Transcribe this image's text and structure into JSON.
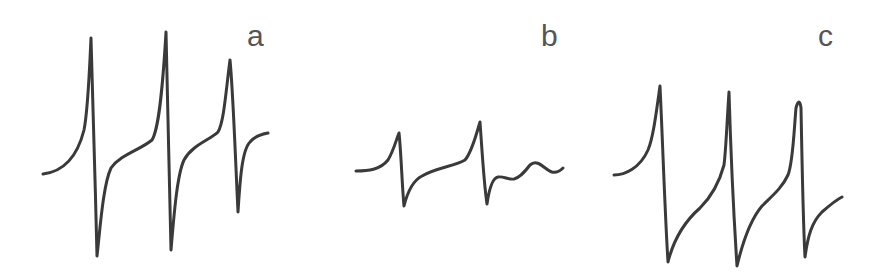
{
  "figure": {
    "panels": [
      {
        "label": "a",
        "line_count": 3,
        "path": "M43,174 C60,172 76,162 84,130 C88,110 89,80 91,38 C93,90 95,180 97,256 C100,230 103,185 111,168 C120,155 140,150 152,140 C158,130 162,100 166,32 C168,100 169,180 171,250 C174,215 177,175 184,160 C192,145 210,140 218,132 C224,122 226,90 230,60 C233,90 235,150 238,212 C240,180 242,150 250,142 C255,136 262,134 268,133"
      },
      {
        "label": "b",
        "line_count": 3,
        "path": "M356,171 C368,171 380,170 388,160 C394,150 396,140 399,133 C401,150 402,185 404,206 C408,190 414,180 422,176 C435,168 455,166 465,160 C472,152 476,135 480,122 C482,150 484,185 487,204 C489,190 492,178 498,177 C504,176 508,180 514,179 C519,178 523,174 530,165 C538,158 545,170 552,172 C556,173 560,171 563,168"
      },
      {
        "label": "c",
        "line_count": 3,
        "path": "M614,175 C625,175 640,168 648,150 C653,138 656,115 660,86 C663,150 665,215 668,262 C674,238 684,222 700,208 C712,196 720,180 724,165 C726,150 727,120 729,92 C731,160 734,220 737,266 C742,245 750,220 762,206 C772,196 782,188 788,175 C793,163 794,130 796,108 C798,100 800,100 801,108 C802,160 803,220 805,257 C808,235 812,222 822,212 C830,205 836,200 842,197"
      }
    ],
    "colors": {
      "trace": "#3a3a3a",
      "label": "#555555",
      "background": "#ffffff"
    }
  }
}
